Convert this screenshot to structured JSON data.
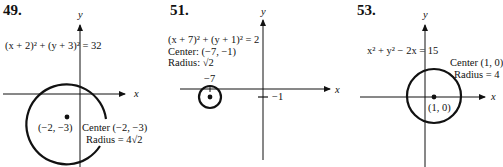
{
  "figures": [
    {
      "number": "49.",
      "equation": "(x + 2)² + (y + 3)² = 32",
      "center_point_label": "(−2, −3)",
      "center_text": "Center (−2, −3)",
      "radius_text": "Radius = 4√2",
      "axis_x": "x",
      "axis_y": "y"
    },
    {
      "number": "51.",
      "equation": "(x + 7)² + (y + 1)² = 2",
      "center_text": "Center: (−7, −1)",
      "radius_text": "Radius: √2",
      "tick_x_label": "−7",
      "tick_y_label": "−1",
      "axis_x": "x",
      "axis_y": "y"
    },
    {
      "number": "53.",
      "equation": "x² + y² − 2x = 15",
      "center_point_label": "(1, 0)",
      "center_text": "Center (1, 0)",
      "radius_text": "Radius = 4",
      "axis_x": "x",
      "axis_y": "y"
    }
  ]
}
